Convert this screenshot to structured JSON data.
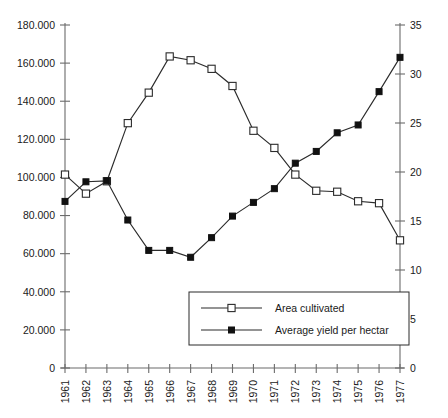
{
  "chart_data": {
    "type": "line",
    "title": "",
    "subtitle": "",
    "xlabel": "",
    "ylabel": "",
    "grid": false,
    "legend_position": "inside-bottom-right",
    "x": [
      1961,
      1962,
      1963,
      1964,
      1965,
      1966,
      1967,
      1968,
      1969,
      1970,
      1971,
      1972,
      1973,
      1974,
      1975,
      1976,
      1977
    ],
    "xtick_labels": [
      "1961",
      "1962",
      "1963",
      "1964",
      "1965",
      "1966",
      "1967",
      "1968",
      "1969",
      "1970",
      "1971",
      "1972",
      "1973",
      "1974",
      "1975",
      "1976",
      "1977"
    ],
    "xlim": [
      1961,
      1977
    ],
    "axes": {
      "left": {
        "ylim": [
          0,
          180000
        ],
        "ticks": [
          0,
          20000,
          40000,
          60000,
          80000,
          100000,
          120000,
          140000,
          160000,
          180000
        ],
        "tick_labels": [
          "0",
          "20.000",
          "40.000",
          "60.000",
          "80.000",
          "100.000",
          "120.000",
          "140.000",
          "160.000",
          "180.000"
        ]
      },
      "right": {
        "ylim": [
          0,
          35
        ],
        "ticks": [
          0,
          5,
          10,
          15,
          20,
          25,
          30,
          35
        ],
        "tick_labels": [
          "0",
          "5",
          "10",
          "15",
          "20",
          "25",
          "30",
          "35"
        ]
      }
    },
    "series": [
      {
        "name": "Area cultivated",
        "axis": "left",
        "marker": "open-square",
        "color": "#2b2b2b",
        "values": [
          101500,
          91500,
          98000,
          128500,
          144500,
          163500,
          161500,
          157000,
          148000,
          124500,
          115500,
          101500,
          93000,
          92500,
          87500,
          86500,
          67000
        ]
      },
      {
        "name": "Average yield per hectar",
        "axis": "right",
        "marker": "filled-square",
        "color": "#111111",
        "values": [
          17.0,
          19.0,
          19.1,
          15.1,
          12.0,
          12.0,
          11.3,
          13.3,
          15.5,
          16.9,
          18.3,
          20.9,
          22.1,
          24.0,
          24.8,
          28.2,
          31.7
        ]
      }
    ]
  },
  "legend": {
    "entries": [
      {
        "label": "Area cultivated",
        "marker": "open-square"
      },
      {
        "label": "Average yield per hectar",
        "marker": "filled-square"
      }
    ]
  }
}
